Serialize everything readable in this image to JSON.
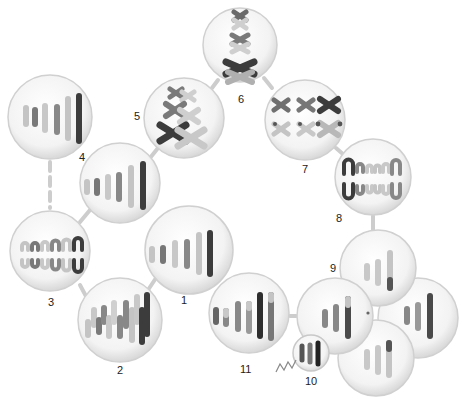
{
  "diagram": {
    "type": "cell-cycle-chromosome-diagram",
    "colors": {
      "cell_fill": "#f4f4f4",
      "cell_edge": "#cfcfcf",
      "chrom_dark": "#3a3a3a",
      "chrom_mid": "#6f6f6f",
      "chrom_light": "#b8b8b8",
      "chrom_pale": "#d6d6d6",
      "connector": "#c8c8c8"
    },
    "cells": [
      {
        "id": "cell-1",
        "label": "1",
        "cx": 189,
        "cy": 250,
        "r": 44,
        "stage": "six elongated chromosomes of increasing length"
      },
      {
        "id": "cell-2",
        "label": "2",
        "cx": 120,
        "cy": 320,
        "r": 42,
        "stage": "replicated chromosomes, overlapping pairs"
      },
      {
        "id": "cell-3",
        "label": "3",
        "cx": 50,
        "cy": 251,
        "r": 40,
        "stage": "paired U-shaped chromosomes (top row arches, bottom row cups)"
      },
      {
        "id": "cell-4",
        "label": "4",
        "cx": 120,
        "cy": 183,
        "r": 40,
        "stage": "six chromosomes of increasing length"
      },
      {
        "id": "cell-4b",
        "label": "",
        "cx": 50,
        "cy": 117,
        "r": 42,
        "stage": "six chromosomes of increasing length"
      },
      {
        "id": "cell-5",
        "label": "5",
        "cx": 184,
        "cy": 118,
        "r": 40,
        "stage": "X-shaped chromosomes, crossing over"
      },
      {
        "id": "cell-6",
        "label": "6",
        "cx": 240,
        "cy": 45,
        "r": 37,
        "stage": "X-shaped chromosomes aligned vertically"
      },
      {
        "id": "cell-7",
        "label": "7",
        "cx": 305,
        "cy": 120,
        "r": 40,
        "stage": "X-shaped chromosomes in two rows"
      },
      {
        "id": "cell-8",
        "label": "8",
        "cx": 373,
        "cy": 177,
        "r": 38,
        "stage": "U-shaped chromosomes separating into two rows"
      },
      {
        "id": "cell-9a",
        "label": "9",
        "cx": 378,
        "cy": 268,
        "r": 38,
        "stage": "daughter cell with three chromosomes"
      },
      {
        "id": "cell-9b",
        "label": "",
        "cx": 418,
        "cy": 318,
        "r": 40,
        "stage": "daughter cell with three chromosomes"
      },
      {
        "id": "cell-9c",
        "label": "",
        "cx": 376,
        "cy": 358,
        "r": 38,
        "stage": "daughter cell with three chromosomes"
      },
      {
        "id": "cell-9d",
        "label": "",
        "cx": 335,
        "cy": 316,
        "r": 38,
        "stage": "daughter cell with three chromosomes"
      },
      {
        "id": "cell-10",
        "label": "10",
        "cx": 311,
        "cy": 353,
        "r": 18,
        "stage": "small cell with three dark chromosomes and tail"
      },
      {
        "id": "cell-11",
        "label": "11",
        "cx": 249,
        "cy": 313,
        "r": 40,
        "stage": "six chromosomes of increasing length"
      }
    ],
    "labels": [
      {
        "text": "1",
        "x": 181,
        "y": 304
      },
      {
        "text": "2",
        "x": 117,
        "y": 374
      },
      {
        "text": "3",
        "x": 48,
        "y": 306
      },
      {
        "text": "4",
        "x": 79,
        "y": 161
      },
      {
        "text": "5",
        "x": 134,
        "y": 120
      },
      {
        "text": "6",
        "x": 238,
        "y": 103
      },
      {
        "text": "7",
        "x": 302,
        "y": 173
      },
      {
        "text": "8",
        "x": 336,
        "y": 222
      },
      {
        "text": "9",
        "x": 330,
        "y": 272
      },
      {
        "text": "10",
        "x": 305,
        "y": 385
      },
      {
        "text": "11",
        "x": 240,
        "y": 373
      }
    ]
  }
}
